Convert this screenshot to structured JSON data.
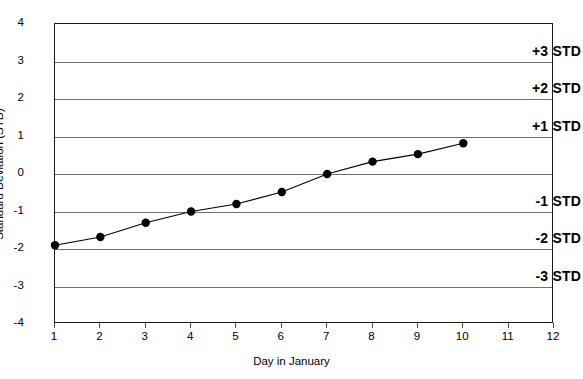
{
  "chart_data": {
    "type": "line",
    "title": "",
    "xlabel": "Day in January",
    "ylabel": "Standard Deviation (STD)",
    "xlim": [
      1,
      12
    ],
    "ylim": [
      -4,
      4
    ],
    "grid": true,
    "legend": "none",
    "x": [
      1,
      2,
      3,
      4,
      5,
      6,
      7,
      8,
      9,
      10
    ],
    "values": [
      -1.9,
      -1.68,
      -1.3,
      -1.0,
      -0.8,
      -0.48,
      0.0,
      0.33,
      0.53,
      0.82
    ],
    "series": [
      {
        "name": "Standard Deviation",
        "x": [
          1,
          2,
          3,
          4,
          5,
          6,
          7,
          8,
          9,
          10
        ],
        "values": [
          -1.9,
          -1.68,
          -1.3,
          -1.0,
          -0.8,
          -0.48,
          0.0,
          0.33,
          0.53,
          0.82
        ],
        "marker": "filled-circle",
        "color": "#000000"
      }
    ],
    "x_ticks": [
      1,
      2,
      3,
      4,
      5,
      6,
      7,
      8,
      9,
      10,
      11,
      12
    ],
    "x_tick_labels": [
      "1",
      "2",
      "3",
      "4",
      "5",
      "6",
      "7",
      "8",
      "9",
      "10",
      "11",
      "12"
    ],
    "y_ticks": [
      4,
      3,
      2,
      1,
      0,
      -1,
      -2,
      -3,
      -4
    ],
    "y_tick_labels": [
      "4",
      "3",
      "2",
      "1",
      "0",
      "-1",
      "-2",
      "-3",
      "-4"
    ],
    "gridline_values": [
      3,
      2,
      1,
      0,
      -1,
      -2,
      -3
    ],
    "annotations": [
      {
        "text": "+3 STD",
        "y": 3
      },
      {
        "text": "+2 STD",
        "y": 2
      },
      {
        "text": "+1 STD",
        "y": 1
      },
      {
        "text": "-1 STD",
        "y": -1
      },
      {
        "text": "-2 STD",
        "y": -2
      },
      {
        "text": "-3 STD",
        "y": -3
      }
    ],
    "colors": {
      "line": "#000000",
      "marker": "#000000",
      "grid": "#6e6e6e",
      "frame": "#1a1a1a",
      "background": "#ffffff",
      "text": "#000000"
    }
  }
}
